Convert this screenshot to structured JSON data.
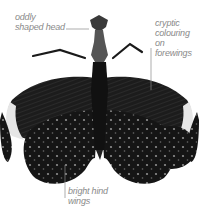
{
  "figure": {
    "annotations": [
      {
        "id": "head",
        "text": "oddly\nshaped head"
      },
      {
        "id": "forewings",
        "text": "cryptic\ncolouring on\nforewings"
      },
      {
        "id": "hindwings",
        "text": "bright hind\nwings"
      }
    ]
  },
  "colors": {
    "background": "#ffffff",
    "wing_dark": "#151515",
    "wing_spot": "#9a9a9a",
    "wing_pale": "#e6e6e6",
    "body": "#3a3a3a",
    "leader_line": "#8a8a8a",
    "label_text": "#8a8a8a"
  }
}
